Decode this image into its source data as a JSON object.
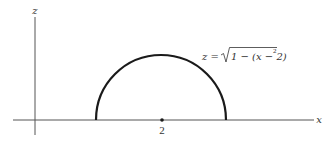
{
  "diagram": {
    "axes": {
      "x_label": "x",
      "z_label": "z"
    },
    "curve": {
      "equation_lhs": "z =",
      "equation_sqrt_body": "1 − (x − 2)",
      "equation_exponent": "2",
      "description": "upper semicircle of radius 1 centered at x = 2"
    },
    "marked_point": {
      "label": "2"
    },
    "colors": {
      "curve": "#1a1a1a",
      "axes": "#555555",
      "background": "#ffffff"
    }
  }
}
